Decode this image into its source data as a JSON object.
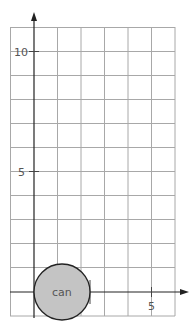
{
  "diagram": {
    "type": "coordinate-grid",
    "x_axis": {
      "tick_labels": [
        {
          "value": 5,
          "label": "5"
        }
      ],
      "unit_px": 23.4
    },
    "y_axis": {
      "tick_labels": [
        {
          "value": 5,
          "label": "5"
        },
        {
          "value": 10,
          "label": "10"
        }
      ],
      "unit_px": 24.1
    },
    "grid": {
      "cols_left_of_axis": 1,
      "cols_right_of_axis": 6,
      "rows_above_axis": 11,
      "rows_below_axis": 1
    },
    "shapes": [
      {
        "kind": "circle",
        "label": "can",
        "center": [
          1.2,
          0
        ],
        "radius_units": 1.2,
        "fill": "#c4c4c4",
        "stroke": "#222222"
      }
    ],
    "colors": {
      "grid": "#a8a8a8",
      "axis": "#222222",
      "label": "#555555",
      "circle_fill": "#c4c4c4"
    }
  },
  "labels": {
    "x5": "5",
    "y5": "5",
    "y10": "10",
    "can": "can"
  }
}
